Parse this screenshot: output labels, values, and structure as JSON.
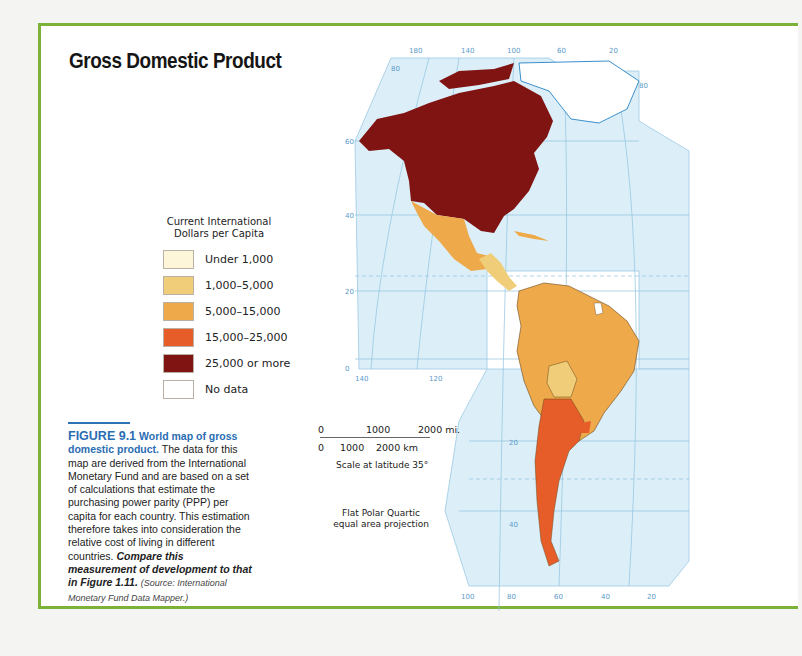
{
  "title": "Gross Domestic Product",
  "legend": {
    "title_line1": "Current International",
    "title_line2": "Dollars per Capita",
    "items": [
      {
        "label": "Under 1,000",
        "color": "#fdf6d8"
      },
      {
        "label": "1,000–5,000",
        "color": "#f0cd78"
      },
      {
        "label": "5,000–15,000",
        "color": "#eea94a"
      },
      {
        "label": "15,000–25,000",
        "color": "#e65d2a"
      },
      {
        "label": "25,000 or more",
        "color": "#7f1412"
      },
      {
        "label": "No data",
        "color": "#ffffff"
      }
    ]
  },
  "caption": {
    "figure": "FIGURE 9.1",
    "heading": "World map of gross domestic product.",
    "body": "The data for this map are derived from the International Monetary Fund and are based on a set of calculations that estimate the purchasing power parity (PPP) per capita for each country. This estimation therefore takes into consideration the relative cost of living in different countries.",
    "prompt": "Compare this measurement of development to that in Figure 1.11.",
    "source": "(Source: International Monetary Fund Data Mapper.)"
  },
  "scale": {
    "mi_0": "0",
    "mi_1000": "1000",
    "mi_2000": "2000 mi.",
    "km_0": "0",
    "km_1000": "1000",
    "km_2000": "2000 km",
    "note": "Scale at latitude 35°"
  },
  "projection": {
    "line1": "Flat Polar Quartic",
    "line2": "equal area projection"
  },
  "map": {
    "top_longitudes": [
      "180",
      "140",
      "100",
      "60",
      "20"
    ],
    "left_latitudes": [
      "80",
      "60",
      "40",
      "20",
      "0"
    ],
    "mid_longitudes": [
      "140",
      "120"
    ],
    "south_latitudes": [
      "20",
      "40"
    ],
    "bottom_longitudes": [
      "100",
      "80",
      "60",
      "40",
      "20"
    ],
    "right_latitude": "80",
    "ocean_color": "#dceff8",
    "grid_color": "#8fc1df"
  }
}
